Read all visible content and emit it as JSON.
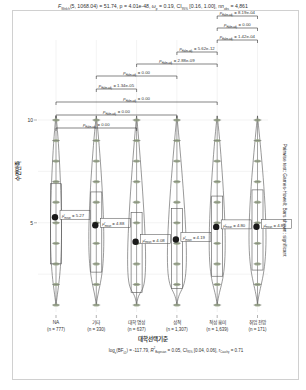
{
  "chart_data": {
    "type": "violin",
    "title_parts": {
      "stat": "F",
      "stat_sub": "Welch",
      "args": "(5, 1068.04) = 51.74, p = 4.01e-48, ",
      "effect": "ω",
      "effect_tail": " = 0.19, CI",
      "ci_sub": "95%",
      "ci_tail": " [0.16, 1.00], n",
      "n_sub": "obs",
      "n_tail": " = 4,861"
    },
    "xlabel": "대학선택기준",
    "ylabel": "수면만족",
    "ylim": [
      1,
      13
    ],
    "yticks": [
      5,
      10
    ],
    "categories": [
      "NA",
      "기타",
      "대학 명성",
      "성적",
      "적성 흥미",
      "취업 전망"
    ],
    "n_labels": [
      "(n = 777)",
      "(n = 330)",
      "(n = 637)",
      "(n = 1,307)",
      "(n = 1,639)",
      "(n = 171)"
    ],
    "means": [
      5.27,
      4.88,
      4.08,
      4.19,
      4.8,
      4.81
    ],
    "mean_labels": [
      "= 5.27",
      "= 4.88",
      "= 4.08",
      "= 4.19",
      "= 4.80",
      "= 4.81"
    ],
    "mean_symbol": "μ̂",
    "mean_sub": "mean",
    "pairwise": [
      {
        "from": 0,
        "to": 2,
        "label": "= 0.00"
      },
      {
        "from": 0,
        "to": 3,
        "label": "= 0.00"
      },
      {
        "from": 0,
        "to": 4,
        "label": "= 0.00"
      },
      {
        "from": 1,
        "to": 2,
        "label": "= 1.34e-05"
      },
      {
        "from": 1,
        "to": 3,
        "label": "= 0.00"
      },
      {
        "from": 2,
        "to": 4,
        "label": "= 2.88e-09"
      },
      {
        "from": 3,
        "to": 4,
        "label": "= 5.62e-12"
      },
      {
        "from": 4,
        "to": 5,
        "label": "= 1.42e-04"
      },
      {
        "from": 4,
        "to": 5,
        "label": "= 0.00"
      },
      {
        "from": 4,
        "to": 5,
        "label": "= 8.19e-04"
      }
    ],
    "p_symbol": "p",
    "p_sub": "Holm-adj.",
    "right_label": "Pairwise test: Games-Howell; Bars shown: significant",
    "footer": {
      "bf": "log",
      "bf_sub": "e",
      "bf_mid": "(BF",
      "bf_sub2": "01",
      "bf_tail": ") = -117.79, ",
      "r2": "R",
      "r2_sup": "2",
      "r2_sub": "Bayesian",
      "r2_tail": " = 0.05, CI",
      "ci_sup": "ETI",
      "ci_sub": "95%",
      "ci_tail": " [0.04, 0.06], r",
      "r_sup": "JZS",
      "r_sub": "Cauchy",
      "r_tail": " = 0.71"
    },
    "legend": "none",
    "grid": true,
    "colors": {
      "point": "#9aa88a",
      "violin": "#555555",
      "mean": "#1a1a1a",
      "grid": "#ebebeb",
      "bracket": "#333333"
    }
  }
}
